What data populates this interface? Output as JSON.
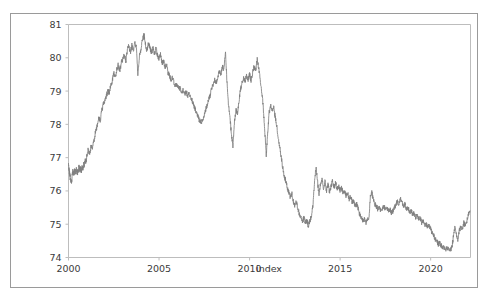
{
  "figure": {
    "background_color": "#ffffff",
    "frame_color": "#9a9a9a",
    "axes_spine_color": "#bdbdbd"
  },
  "chart_data": {
    "type": "line",
    "title": "",
    "subtitle": "",
    "xlabel": "index",
    "ylabel": "",
    "xlim": [
      2000.0,
      2022.2
    ],
    "ylim": [
      74,
      81
    ],
    "grid": false,
    "legend": null,
    "legend_position": "none",
    "line_color": "#7f7f7f",
    "line_width": 0.85,
    "xticks": [
      2000,
      2005,
      2010,
      2015,
      2020
    ],
    "xtick_labels": [
      "2000",
      "2005",
      "2010",
      "2015",
      "2020"
    ],
    "yticks": [
      74,
      75,
      76,
      77,
      78,
      79,
      80,
      81
    ],
    "ytick_labels": [
      "74",
      "75",
      "76",
      "77",
      "78",
      "79",
      "80",
      "81"
    ],
    "series": [
      {
        "name": "index",
        "x": [
          2000.0,
          2000.04,
          2000.08,
          2000.12,
          2000.17,
          2000.21,
          2000.25,
          2000.29,
          2000.33,
          2000.38,
          2000.42,
          2000.46,
          2000.5,
          2000.54,
          2000.58,
          2000.62,
          2000.67,
          2000.71,
          2000.75,
          2000.79,
          2000.83,
          2000.88,
          2000.92,
          2000.96,
          2001.0,
          2001.08,
          2001.17,
          2001.25,
          2001.33,
          2001.42,
          2001.5,
          2001.58,
          2001.67,
          2001.75,
          2001.83,
          2001.92,
          2002.0,
          2002.08,
          2002.17,
          2002.25,
          2002.33,
          2002.42,
          2002.5,
          2002.58,
          2002.67,
          2002.75,
          2002.83,
          2002.92,
          2003.0,
          2003.08,
          2003.17,
          2003.25,
          2003.33,
          2003.42,
          2003.5,
          2003.58,
          2003.67,
          2003.75,
          2003.83,
          2003.92,
          2004.0,
          2004.08,
          2004.17,
          2004.25,
          2004.33,
          2004.42,
          2004.5,
          2004.58,
          2004.67,
          2004.75,
          2004.83,
          2004.92,
          2005.0,
          2005.08,
          2005.17,
          2005.25,
          2005.33,
          2005.42,
          2005.5,
          2005.58,
          2005.67,
          2005.75,
          2005.83,
          2005.92,
          2006.0,
          2006.08,
          2006.17,
          2006.25,
          2006.33,
          2006.42,
          2006.5,
          2006.58,
          2006.67,
          2006.75,
          2006.83,
          2006.92,
          2007.0,
          2007.08,
          2007.17,
          2007.25,
          2007.33,
          2007.42,
          2007.5,
          2007.58,
          2007.67,
          2007.75,
          2007.83,
          2007.92,
          2008.0,
          2008.08,
          2008.17,
          2008.25,
          2008.33,
          2008.42,
          2008.5,
          2008.58,
          2008.67,
          2008.75,
          2008.83,
          2008.92,
          2009.0,
          2009.08,
          2009.17,
          2009.25,
          2009.33,
          2009.42,
          2009.5,
          2009.58,
          2009.67,
          2009.75,
          2009.83,
          2009.92,
          2010.0,
          2010.08,
          2010.17,
          2010.25,
          2010.33,
          2010.42,
          2010.5,
          2010.58,
          2010.67,
          2010.75,
          2010.83,
          2010.92,
          2011.0,
          2011.08,
          2011.17,
          2011.25,
          2011.33,
          2011.42,
          2011.5,
          2011.58,
          2011.67,
          2011.75,
          2011.83,
          2011.92,
          2012.0,
          2012.08,
          2012.17,
          2012.25,
          2012.33,
          2012.42,
          2012.5,
          2012.58,
          2012.67,
          2012.75,
          2012.83,
          2012.92,
          2013.0,
          2013.08,
          2013.17,
          2013.25,
          2013.33,
          2013.42,
          2013.5,
          2013.58,
          2013.67,
          2013.75,
          2013.83,
          2013.92,
          2014.0,
          2014.08,
          2014.17,
          2014.25,
          2014.33,
          2014.42,
          2014.5,
          2014.58,
          2014.67,
          2014.75,
          2014.83,
          2014.92,
          2015.0,
          2015.08,
          2015.17,
          2015.25,
          2015.33,
          2015.42,
          2015.5,
          2015.58,
          2015.67,
          2015.75,
          2015.83,
          2015.92,
          2016.0,
          2016.08,
          2016.17,
          2016.25,
          2016.33,
          2016.42,
          2016.5,
          2016.58,
          2016.67,
          2016.75,
          2016.83,
          2016.92,
          2017.0,
          2017.08,
          2017.17,
          2017.25,
          2017.33,
          2017.42,
          2017.5,
          2017.58,
          2017.67,
          2017.75,
          2017.83,
          2017.92,
          2018.0,
          2018.08,
          2018.17,
          2018.25,
          2018.33,
          2018.42,
          2018.5,
          2018.58,
          2018.67,
          2018.75,
          2018.83,
          2018.92,
          2019.0,
          2019.08,
          2019.17,
          2019.25,
          2019.33,
          2019.42,
          2019.5,
          2019.58,
          2019.67,
          2019.75,
          2019.83,
          2019.92,
          2020.0,
          2020.08,
          2020.17,
          2020.25,
          2020.33,
          2020.42,
          2020.5,
          2020.58,
          2020.67,
          2020.75,
          2020.83,
          2020.92,
          2021.0,
          2021.08,
          2021.17,
          2021.25,
          2021.33,
          2021.42,
          2021.5,
          2021.58,
          2021.67,
          2021.75,
          2021.83,
          2021.92,
          2022.0,
          2022.08,
          2022.17
        ],
        "values": [
          76.85,
          76.6,
          76.45,
          76.3,
          76.25,
          76.55,
          76.6,
          76.5,
          76.62,
          76.55,
          76.7,
          76.58,
          76.55,
          76.62,
          76.75,
          76.62,
          76.7,
          76.6,
          76.72,
          76.66,
          76.8,
          76.75,
          76.9,
          76.85,
          77.0,
          77.25,
          77.1,
          77.35,
          77.3,
          77.55,
          77.8,
          77.95,
          78.2,
          78.1,
          78.4,
          78.6,
          78.7,
          78.85,
          79.0,
          78.95,
          79.15,
          79.3,
          79.55,
          79.4,
          79.65,
          79.8,
          79.6,
          79.85,
          79.95,
          80.1,
          79.9,
          80.25,
          80.35,
          80.15,
          80.4,
          80.2,
          80.45,
          80.3,
          79.5,
          80.1,
          80.25,
          80.55,
          80.68,
          80.4,
          80.2,
          80.45,
          80.3,
          80.15,
          80.28,
          80.1,
          80.3,
          80.05,
          79.95,
          80.1,
          79.85,
          79.9,
          79.7,
          79.8,
          79.55,
          79.45,
          79.35,
          79.4,
          79.25,
          79.15,
          79.2,
          79.05,
          79.1,
          78.95,
          79.05,
          78.9,
          79.0,
          78.85,
          78.95,
          78.8,
          78.7,
          78.55,
          78.45,
          78.3,
          78.2,
          78.1,
          78.05,
          78.15,
          78.3,
          78.45,
          78.6,
          78.75,
          78.9,
          79.1,
          79.2,
          79.35,
          79.25,
          79.45,
          79.6,
          79.5,
          79.75,
          79.65,
          80.15,
          79.3,
          78.6,
          78.2,
          77.65,
          77.35,
          78.1,
          78.45,
          78.3,
          78.7,
          79.05,
          79.25,
          79.4,
          79.3,
          79.45,
          79.35,
          79.5,
          79.3,
          79.55,
          79.75,
          79.6,
          79.95,
          79.7,
          79.4,
          79.0,
          78.55,
          77.9,
          77.05,
          77.75,
          78.35,
          78.55,
          78.4,
          78.55,
          78.2,
          77.95,
          77.6,
          77.3,
          77.0,
          76.7,
          76.45,
          76.3,
          76.1,
          75.95,
          75.8,
          75.95,
          75.7,
          75.55,
          75.7,
          75.45,
          75.3,
          75.2,
          75.05,
          75.2,
          75.05,
          75.1,
          74.95,
          75.1,
          75.25,
          75.6,
          76.2,
          76.75,
          76.3,
          75.9,
          76.2,
          76.35,
          76.05,
          76.3,
          76.0,
          76.2,
          75.95,
          76.15,
          76.3,
          76.1,
          76.25,
          76.05,
          76.15,
          76.0,
          76.1,
          75.9,
          76.0,
          75.85,
          75.95,
          75.75,
          75.85,
          75.65,
          75.7,
          75.55,
          75.6,
          75.45,
          75.3,
          75.2,
          75.1,
          75.15,
          75.05,
          75.15,
          75.1,
          75.85,
          75.95,
          75.75,
          75.6,
          75.55,
          75.45,
          75.5,
          75.4,
          75.45,
          75.55,
          75.45,
          75.5,
          75.4,
          75.45,
          75.35,
          75.4,
          75.5,
          75.6,
          75.7,
          75.6,
          75.75,
          75.65,
          75.55,
          75.6,
          75.45,
          75.5,
          75.35,
          75.4,
          75.3,
          75.35,
          75.2,
          75.25,
          75.15,
          75.2,
          75.05,
          75.1,
          74.95,
          75.0,
          74.9,
          74.95,
          74.85,
          74.75,
          74.65,
          74.55,
          74.5,
          74.4,
          74.45,
          74.35,
          74.3,
          74.28,
          74.25,
          74.3,
          74.25,
          74.22,
          74.3,
          74.6,
          74.9,
          74.7,
          74.55,
          74.8,
          74.95,
          74.85,
          75.05,
          74.95,
          75.1,
          75.3,
          75.4
        ]
      }
    ]
  }
}
